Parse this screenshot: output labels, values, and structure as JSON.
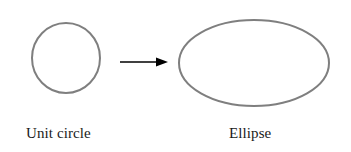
{
  "figure": {
    "background_color": "#ffffff",
    "shape_stroke_color": "#7f7f7f",
    "arrow_color": "#000000",
    "text_color": "#1a1a1a",
    "left_shape": {
      "icon": "circle-outline",
      "label": "Unit circle",
      "center_x": 66,
      "center_y": 58,
      "radius_x": 34,
      "radius_y": 35,
      "stroke_width": 2
    },
    "arrow": {
      "icon": "right-arrow",
      "x1": 120,
      "y1": 62,
      "x2": 168,
      "y2": 62,
      "head_length": 12,
      "head_width": 9,
      "line_width": 1.6
    },
    "right_shape": {
      "icon": "ellipse-outline",
      "label": "Ellipse",
      "center_x": 254,
      "center_y": 63,
      "radius_x": 75,
      "radius_y": 43,
      "stroke_width": 2
    }
  }
}
